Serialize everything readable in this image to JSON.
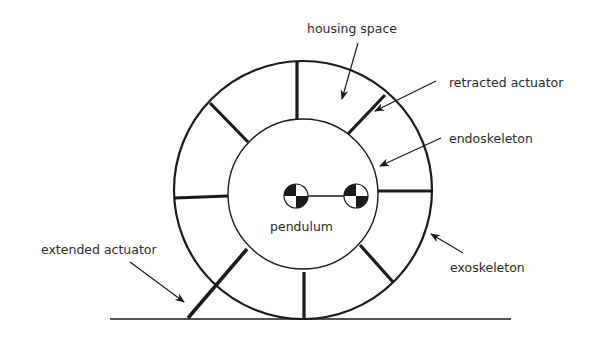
{
  "diagram": {
    "title": "",
    "colors": {
      "stroke": "#1a1a1a",
      "text": "#2b2b2b",
      "background": "#ffffff"
    },
    "labels": {
      "housing_space": "housing space",
      "retracted_actuator": "retracted actuator",
      "endoskeleton": "endoskeleton",
      "pendulum": "pendulum",
      "extended_actuator": "extended actuator",
      "exoskeleton": "exoskeleton"
    },
    "components": [
      {
        "id": "exoskeleton",
        "shape": "circle",
        "role": "outer rim"
      },
      {
        "id": "endoskeleton",
        "shape": "circle",
        "role": "inner hub"
      },
      {
        "id": "actuators",
        "count": 8,
        "states": [
          "retracted",
          "extended"
        ]
      },
      {
        "id": "pendulum",
        "masses": 2,
        "symbol": "center-of-mass marker"
      },
      {
        "id": "ground",
        "shape": "line"
      }
    ]
  }
}
